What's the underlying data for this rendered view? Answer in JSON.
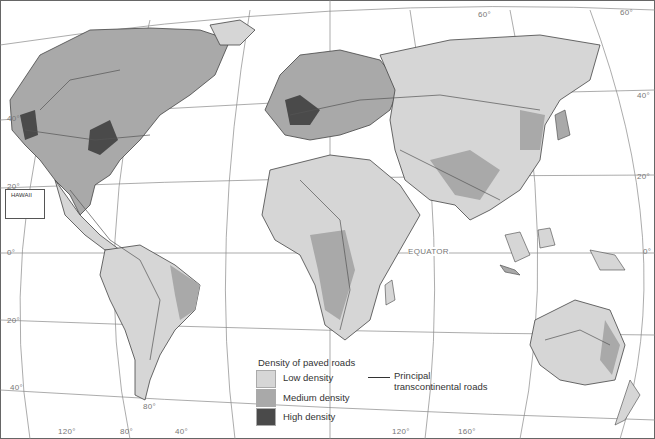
{
  "map": {
    "title": "Density of paved roads",
    "legend": {
      "title": "Density of paved roads",
      "items": [
        {
          "label": "Low density",
          "color": "#d6d6d6"
        },
        {
          "label": "Medium density",
          "color": "#a9a9a9"
        },
        {
          "label": "High density",
          "color": "#4a4a4a"
        }
      ],
      "road_key": {
        "line1": "Principal",
        "line2": "transcontinental roads"
      }
    },
    "inset": {
      "label": "HAWAII"
    },
    "labels": {
      "equator": "EQUATOR",
      "lat_60_a": "60°",
      "lat_60_b": "60°",
      "lat_40_left": "40°",
      "lat_40_right": "40°",
      "lat_20_left": "20°",
      "lat_20_right": "20°",
      "lat_0_left": "0°",
      "lat_0_right": "0°",
      "lat_20s_left": "20°",
      "lat_40s_left": "40°",
      "lon_120w": "120°",
      "lon_80w": "80°",
      "lon_40w": "40°",
      "lon_120e": "120°",
      "lon_160e": "160°",
      "lon_80_inner": "80°"
    },
    "colors": {
      "ocean": "#ffffff",
      "land_low": "#d6d6d6",
      "land_medium": "#a9a9a9",
      "land_high": "#4a4a4a",
      "grid": "#888888",
      "road": "#555555"
    }
  }
}
